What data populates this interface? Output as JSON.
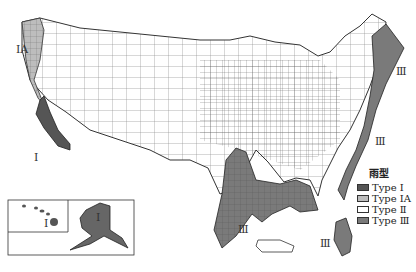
{
  "map": {
    "subject": "United States rainfall distribution types",
    "region_labels": [
      {
        "id": "ia-northwest",
        "text": "IA"
      },
      {
        "id": "i-california",
        "text": "I"
      },
      {
        "id": "iii-northeast",
        "text": "Ⅲ"
      },
      {
        "id": "iii-midatlantic",
        "text": "Ⅲ"
      },
      {
        "id": "iii-gulf",
        "text": "Ⅲ"
      },
      {
        "id": "iii-florida",
        "text": "Ⅲ"
      },
      {
        "id": "i-hawaii",
        "text": "I"
      },
      {
        "id": "i-alaska",
        "text": "I"
      }
    ]
  },
  "legend": {
    "title": "雨型",
    "items": [
      {
        "label": "Type Ⅰ",
        "color": "#555555"
      },
      {
        "label": "Type ⅠA",
        "color": "#bdbdbd"
      },
      {
        "label": "Type Ⅱ",
        "color": "#ffffff"
      },
      {
        "label": "Type Ⅲ",
        "color": "#7a7a7a"
      }
    ]
  },
  "colors": {
    "type_i": "#555555",
    "type_ia": "#bdbdbd",
    "type_ii": "#ffffff",
    "type_iii": "#7a7a7a",
    "border": "#333333"
  }
}
